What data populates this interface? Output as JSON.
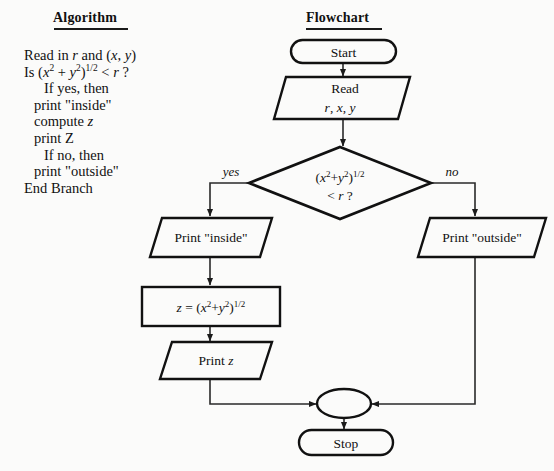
{
  "columns": {
    "algorithm_heading": "Algorithm",
    "flowchart_heading": "Flowchart"
  },
  "algorithm": {
    "lines": [
      "Read in r and (x, y)",
      "Is (x2 + y2)1/2 < r ?",
      "If yes, then",
      "print \"inside\"",
      "compute z",
      "print Z",
      "If no, then",
      "print \"outside\"",
      "End Branch"
    ]
  },
  "flowchart": {
    "nodes": {
      "start": {
        "type": "terminator",
        "label": "Start"
      },
      "read": {
        "type": "input",
        "label_line1": "Read",
        "label_line2": "r, x, y"
      },
      "decision": {
        "type": "decision",
        "label_line1": "(x2+y2)1/2",
        "label_line2": "< r ?"
      },
      "print_inside": {
        "type": "output",
        "label": "Print \"inside\""
      },
      "print_outside": {
        "type": "output",
        "label": "Print \"outside\""
      },
      "compute_z": {
        "type": "process",
        "label": "z = (x2+y2)1/2"
      },
      "print_z": {
        "type": "output",
        "label": "Print z"
      },
      "merge": {
        "type": "connector",
        "label": ""
      },
      "stop": {
        "type": "terminator",
        "label": "Stop"
      }
    },
    "branch_labels": {
      "yes": "yes",
      "no": "no"
    }
  },
  "colors": {
    "ink": "#111111",
    "line": "#2a2a2a",
    "page": "#fbfbfa"
  }
}
